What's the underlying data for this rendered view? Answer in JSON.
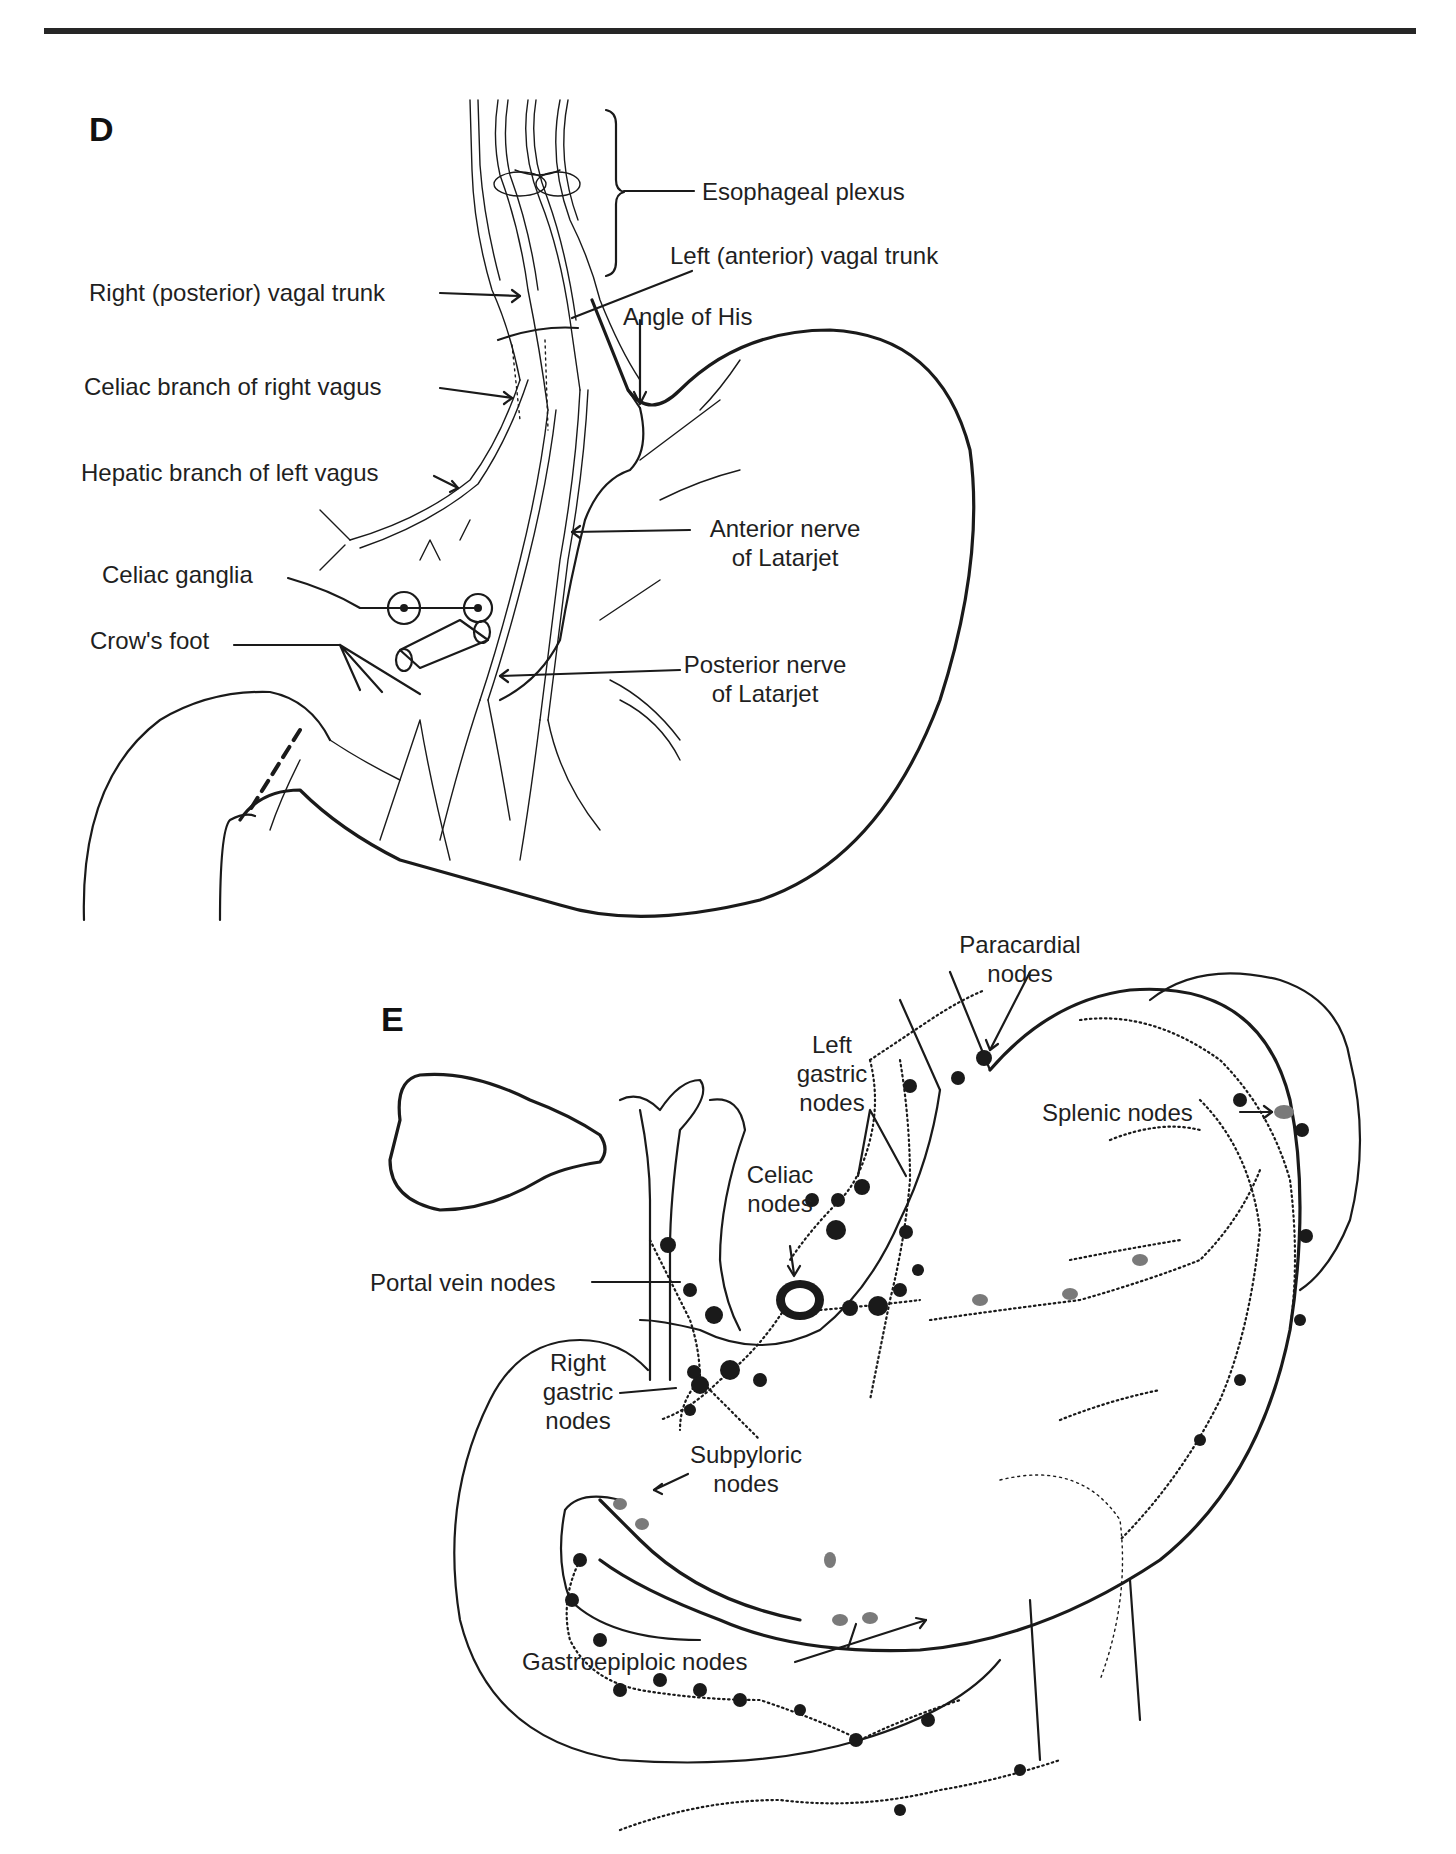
{
  "figure": {
    "panels": [
      {
        "id": "D",
        "letter": "D",
        "subject": "Vagal innervation of the stomach",
        "labels": {
          "esophageal_plexus": "Esophageal plexus",
          "left_vagal_trunk": "Left (anterior) vagal trunk",
          "right_vagal_trunk": "Right (posterior) vagal trunk",
          "angle_of_his": "Angle of His",
          "celiac_branch": "Celiac branch of right vagus",
          "hepatic_branch": "Hepatic branch of left vagus",
          "anterior_latarjet_1": "Anterior nerve",
          "anterior_latarjet_2": "of Latarjet",
          "celiac_ganglia": "Celiac ganglia",
          "crows_foot": "Crow's foot",
          "posterior_latarjet_1": "Posterior nerve",
          "posterior_latarjet_2": "of Latarjet"
        }
      },
      {
        "id": "E",
        "letter": "E",
        "subject": "Lymphatic drainage of the stomach",
        "labels": {
          "paracardial_1": "Paracardial",
          "paracardial_2": "nodes",
          "left_gastric_1": "Left",
          "left_gastric_2": "gastric",
          "left_gastric_3": "nodes",
          "splenic": "Splenic nodes",
          "celiac_1": "Celiac",
          "celiac_2": "nodes",
          "portal_vein": "Portal vein nodes",
          "right_gastric_1": "Right",
          "right_gastric_2": "gastric",
          "right_gastric_3": "nodes",
          "subpyloric_1": "Subpyloric",
          "subpyloric_2": "nodes",
          "gastroepiploic": "Gastroepiploic nodes"
        }
      }
    ]
  }
}
